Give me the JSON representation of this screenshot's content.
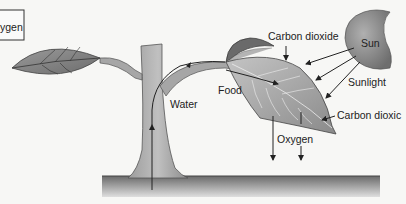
{
  "diagram": {
    "labels": {
      "oxygen_box": "ygen",
      "carbon_dioxide_top": "Carbon dioxide",
      "sun": "Sun",
      "sunlight": "Sunlight",
      "food": "Food",
      "water": "Water",
      "carbon_dioxide_right": "Carbon dioxic",
      "oxygen_bottom": "Oxygen"
    },
    "colors": {
      "background": "#f7f7f5",
      "leaf_dark": "#7a7a7a",
      "leaf_light": "#b8b8b8",
      "stem": "#a8a8a8",
      "sun": "#8e8e8e",
      "ground_top": "#6f6f6f",
      "ground_bottom": "#d8d8d8",
      "line": "#222222"
    }
  }
}
